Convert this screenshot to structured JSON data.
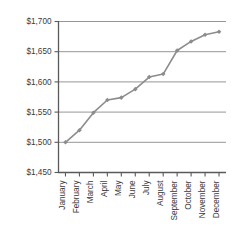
{
  "chart_data": {
    "type": "line",
    "title": "",
    "subtitle": "",
    "xlabel": "",
    "ylabel": "",
    "categories": [
      "January",
      "February",
      "March",
      "April",
      "May",
      "June",
      "July",
      "August",
      "September",
      "October",
      "November",
      "December"
    ],
    "values": [
      1500,
      1520,
      1549,
      1570,
      1574,
      1588,
      1608,
      1613,
      1652,
      1667,
      1678,
      1683
    ],
    "series": [
      {
        "name": "",
        "values": [
          1500,
          1520,
          1549,
          1570,
          1574,
          1588,
          1608,
          1613,
          1652,
          1667,
          1678,
          1683
        ]
      }
    ],
    "ylim": [
      1450,
      1700
    ],
    "ytick_values": [
      1450,
      1500,
      1550,
      1600,
      1650,
      1700
    ],
    "ytick_labels": [
      "$1,450",
      "$1,500",
      "$1,550",
      "$1,600",
      "$1,650",
      "$1,700"
    ],
    "xtick_labels": [
      "January",
      "February",
      "March",
      "April",
      "May",
      "June",
      "July",
      "August",
      "September",
      "October",
      "November",
      "December"
    ],
    "grid": true,
    "grid_axis": "y",
    "legend": false,
    "legend_position": "none",
    "marker": "diamond",
    "annotations": []
  },
  "style": {
    "line_color": "#8c8c8c",
    "marker_color": "#8c8c8c",
    "grid_color": "#8a8a8a",
    "axis_color": "#5a5a5a",
    "text_color": "#3a3a3a",
    "background": "#ffffff"
  }
}
